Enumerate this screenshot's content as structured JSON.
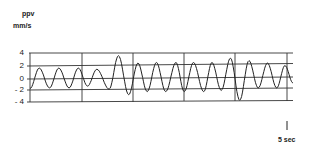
{
  "chart_data": {
    "type": "line",
    "title": "",
    "ylabel": "ppv",
    "yunit": "mm/s",
    "xlabel": "",
    "ylim": [
      -4,
      4
    ],
    "yticks": [
      4,
      2,
      0,
      -2,
      -4
    ],
    "ytick_labels": [
      "4",
      "2",
      "0",
      "- 2",
      "- 4"
    ],
    "grid": true,
    "time_scale_bar": "5 sec",
    "vertical_dividers": 5,
    "segment_duration_sec": 5,
    "total_duration_sec": 25,
    "series": [
      {
        "name": "ppv waveform",
        "t_sec": [
          0.0,
          0.9,
          1.9,
          2.8,
          3.8,
          4.7,
          5.6,
          6.5,
          7.7,
          8.6,
          9.6,
          10.5,
          11.4,
          12.3,
          13.2,
          14.2,
          15.0,
          15.9,
          16.9,
          17.7,
          18.6,
          19.5,
          20.4,
          21.3,
          22.2,
          23.1,
          24.0,
          24.8
        ],
        "values": [
          -1.7,
          1.6,
          -1.6,
          1.6,
          -1.6,
          1.6,
          -1.3,
          1.4,
          -1.8,
          3.6,
          -2.7,
          2.4,
          -2.2,
          2.5,
          -2.2,
          2.5,
          -2.2,
          2.5,
          -2.2,
          2.5,
          -2.0,
          3.2,
          -3.6,
          2.8,
          -1.6,
          2.4,
          -1.6,
          2.0
        ]
      }
    ]
  },
  "labels": {
    "ppv": "ppv",
    "unit": "mm/s",
    "y4": "4",
    "y2": "2",
    "y0": "0",
    "ym2": "- 2",
    "ym4": "- 4",
    "timescale": "5 sec"
  }
}
